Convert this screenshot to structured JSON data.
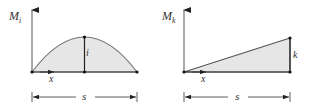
{
  "diagrams": [
    {
      "name": "moment-diagram-i",
      "axis_label_main": "M",
      "axis_label_sub": "i",
      "shape": "parabola",
      "ordinate_label": "i",
      "x_label": "x",
      "span_label": "s",
      "fill_color": "#e6e6e6",
      "stroke_color": "#777777"
    },
    {
      "name": "moment-diagram-k",
      "axis_label_main": "M",
      "axis_label_sub": "k",
      "shape": "triangle",
      "ordinate_label": "k",
      "x_label": "x",
      "span_label": "s",
      "fill_color": "#e6e6e6",
      "stroke_color": "#555555"
    }
  ]
}
